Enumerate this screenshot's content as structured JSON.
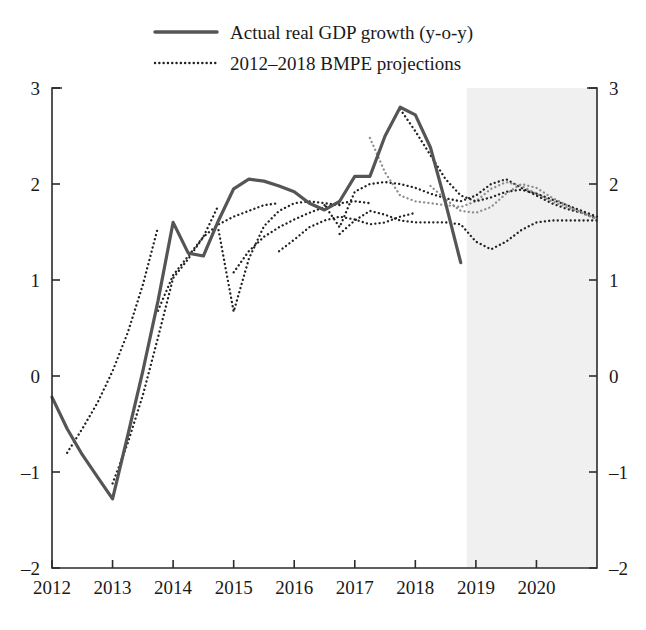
{
  "legend": {
    "items": [
      {
        "label": "Actual real GDP growth (y-o-y)",
        "style": "solid",
        "color": "#555555"
      },
      {
        "label": "2012–2018 BMPE projections",
        "style": "dotted",
        "color": "#222222"
      }
    ]
  },
  "axes": {
    "y_left_ticks": [
      "3",
      "2",
      "1",
      "0",
      "-1",
      "-2"
    ],
    "y_right_ticks": [
      "3",
      "2",
      "1",
      "0",
      "-1",
      "-2"
    ],
    "x_ticks": [
      "2012",
      "2013",
      "2014",
      "2015",
      "2016",
      "2017",
      "2018",
      "2019",
      "2020"
    ]
  },
  "colors": {
    "actual_line": "#555555",
    "projection_line": "#222222",
    "projection_line_light": "#8d8d8d",
    "axis": "#2b2b2b",
    "forecast_shading": "#f0f0f0",
    "background": "#ffffff"
  },
  "chart_data": {
    "type": "line",
    "title": "",
    "subtitle": "",
    "xlabel": "",
    "ylabel": "",
    "xlim": [
      2012.0,
      2021.0
    ],
    "ylim": [
      -2,
      3
    ],
    "yticks": [
      -2,
      -1,
      0,
      1,
      2,
      3
    ],
    "xticks": [
      2012,
      2013,
      2014,
      2015,
      2016,
      2017,
      2018,
      2019,
      2020
    ],
    "grid": false,
    "legend_position": "top-center",
    "annotations": [
      {
        "type": "shaded-region",
        "label": "forecast horizon",
        "x_start": 2018.85,
        "x_end": 2021.0
      }
    ],
    "series": [
      {
        "name": "Actual real GDP growth (y-o-y)",
        "style": "solid",
        "color": "#555555",
        "x": [
          2012.0,
          2012.25,
          2012.5,
          2012.75,
          2013.0,
          2013.25,
          2013.5,
          2013.75,
          2014.0,
          2014.25,
          2014.5,
          2014.75,
          2015.0,
          2015.25,
          2015.5,
          2015.75,
          2016.0,
          2016.25,
          2016.5,
          2016.75,
          2017.0,
          2017.25,
          2017.5,
          2017.75,
          2018.0,
          2018.25,
          2018.5,
          2018.75
        ],
        "values": [
          -0.22,
          -0.55,
          -0.82,
          -1.05,
          -1.28,
          -0.62,
          0.05,
          0.78,
          1.6,
          1.28,
          1.25,
          1.62,
          1.95,
          2.05,
          2.03,
          1.98,
          1.92,
          1.8,
          1.73,
          1.82,
          2.08,
          2.08,
          2.5,
          2.8,
          2.72,
          2.38,
          1.8,
          1.18
        ]
      },
      {
        "name": "BMPE projection 2012",
        "style": "dotted",
        "color": "#222222",
        "x": [
          2012.25,
          2012.5,
          2012.75,
          2013.0,
          2013.25,
          2013.5,
          2013.75
        ],
        "values": [
          -0.8,
          -0.55,
          -0.28,
          0.05,
          0.45,
          0.95,
          1.55
        ]
      },
      {
        "name": "BMPE projection 2013",
        "style": "dotted",
        "color": "#222222",
        "x": [
          2013.0,
          2013.25,
          2013.5,
          2013.75,
          2014.0,
          2014.25,
          2014.5,
          2014.75
        ],
        "values": [
          -1.12,
          -0.7,
          -0.2,
          0.4,
          1.02,
          1.22,
          1.45,
          1.78
        ]
      },
      {
        "name": "BMPE projection 2014",
        "style": "dotted",
        "color": "#222222",
        "x": [
          2013.75,
          2014.0,
          2014.25,
          2014.5,
          2014.75,
          2015.0,
          2015.25,
          2015.5,
          2015.75
        ],
        "values": [
          0.68,
          1.05,
          1.25,
          1.45,
          1.58,
          1.66,
          1.72,
          1.78,
          1.8
        ]
      },
      {
        "name": "BMPE projection 2015a",
        "style": "dotted",
        "color": "#222222",
        "x": [
          2014.75,
          2015.0,
          2015.25,
          2015.5,
          2015.75,
          2016.0,
          2016.25,
          2016.5,
          2016.75
        ],
        "values": [
          1.52,
          0.67,
          1.22,
          1.56,
          1.72,
          1.8,
          1.82,
          1.8,
          1.78
        ]
      },
      {
        "name": "BMPE projection 2015b",
        "style": "dotted",
        "color": "#222222",
        "x": [
          2015.0,
          2015.25,
          2015.5,
          2015.75,
          2016.0,
          2016.25,
          2016.5,
          2016.75,
          2017.0,
          2017.25
        ],
        "values": [
          1.08,
          1.3,
          1.45,
          1.55,
          1.63,
          1.7,
          1.76,
          1.8,
          1.82,
          1.8
        ]
      },
      {
        "name": "BMPE projection 2016",
        "style": "dotted",
        "color": "#222222",
        "x": [
          2015.75,
          2016.0,
          2016.25,
          2016.5,
          2016.75,
          2017.0,
          2017.25,
          2017.5,
          2017.75,
          2018.0
        ],
        "values": [
          1.3,
          1.42,
          1.55,
          1.62,
          1.66,
          1.63,
          1.58,
          1.6,
          1.66,
          1.7
        ]
      },
      {
        "name": "BMPE projection 2017a",
        "style": "dotted",
        "color": "#222222",
        "x": [
          2016.5,
          2016.75,
          2017.0,
          2017.25,
          2017.5,
          2017.75,
          2018.0,
          2018.25,
          2018.5,
          2018.75,
          2019.0,
          2019.25,
          2019.5,
          2019.75,
          2020.0,
          2020.25,
          2020.5,
          2020.75,
          2021.0
        ],
        "values": [
          1.78,
          1.55,
          1.92,
          2.0,
          2.02,
          2.0,
          1.96,
          1.9,
          1.85,
          1.82,
          1.88,
          2.0,
          2.05,
          1.96,
          1.88,
          1.8,
          1.74,
          1.7,
          1.64
        ]
      },
      {
        "name": "BMPE projection 2017b",
        "style": "dotted",
        "color": "#8d8d8d",
        "x": [
          2017.25,
          2017.5,
          2017.75,
          2018.0,
          2018.25,
          2018.5,
          2018.75,
          2019.0,
          2019.25,
          2019.5,
          2019.75,
          2020.0,
          2020.25,
          2020.5,
          2020.75,
          2021.0
        ],
        "values": [
          2.48,
          2.12,
          1.88,
          1.82,
          1.8,
          1.78,
          1.76,
          1.82,
          1.95,
          2.02,
          1.98,
          1.9,
          1.82,
          1.76,
          1.7,
          1.64
        ]
      },
      {
        "name": "BMPE projection 2018a",
        "style": "dotted",
        "color": "#222222",
        "x": [
          2017.75,
          2018.0,
          2018.25,
          2018.5,
          2018.75,
          2019.0,
          2019.25,
          2019.5,
          2019.75,
          2020.0,
          2020.25,
          2020.5,
          2020.75,
          2021.0
        ],
        "values": [
          2.78,
          2.55,
          2.3,
          2.05,
          1.88,
          1.82,
          1.86,
          1.92,
          1.94,
          1.9,
          1.84,
          1.78,
          1.72,
          1.66
        ]
      },
      {
        "name": "BMPE projection 2018b",
        "style": "dotted",
        "color": "#222222",
        "x": [
          2016.75,
          2017.0,
          2017.25,
          2017.5,
          2017.75,
          2018.0,
          2018.25,
          2018.5,
          2018.75,
          2019.0,
          2019.25,
          2019.5,
          2019.75,
          2020.0,
          2020.25,
          2020.5,
          2020.75,
          2021.0
        ],
        "values": [
          1.48,
          1.62,
          1.72,
          1.68,
          1.62,
          1.6,
          1.6,
          1.6,
          1.58,
          1.4,
          1.32,
          1.4,
          1.52,
          1.6,
          1.62,
          1.62,
          1.62,
          1.62
        ]
      },
      {
        "name": "BMPE projection 2018c",
        "style": "dotted",
        "color": "#8d8d8d",
        "x": [
          2018.25,
          2018.5,
          2018.75,
          2019.0,
          2019.25,
          2019.5,
          2019.75,
          2020.0,
          2020.25,
          2020.5,
          2020.75,
          2021.0
        ],
        "values": [
          1.98,
          1.84,
          1.72,
          1.7,
          1.76,
          1.9,
          2.0,
          1.96,
          1.86,
          1.78,
          1.7,
          1.63
        ]
      }
    ]
  }
}
